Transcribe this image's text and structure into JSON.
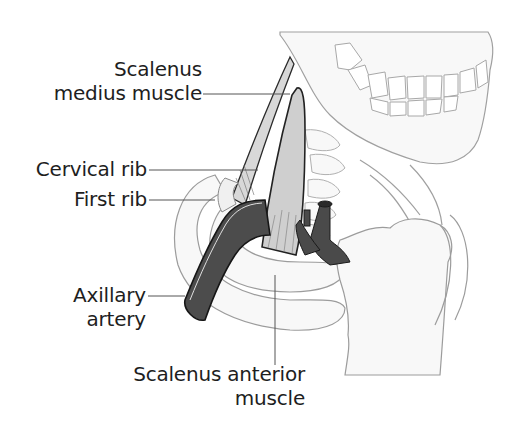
{
  "diagram": {
    "type": "anatomical illustration",
    "labels": {
      "scalenus_medius": {
        "line1": "Scalenus",
        "line2": "medius muscle"
      },
      "cervical_rib": "Cervical rib",
      "first_rib": "First rib",
      "axillary_artery": {
        "line1": "Axillary",
        "line2": "artery"
      },
      "scalenus_anterior": {
        "line1": "Scalenus anterior",
        "line2": "muscle"
      }
    },
    "colors": {
      "background": "#ffffff",
      "text": "#1e1e1e",
      "leader_line": "#555555",
      "bone_outline": "#9a9a9a",
      "bone_fill": "#f6f6f6",
      "muscle_fill": "#d2d2d2",
      "muscle_outline": "#2a2a2a",
      "artery_fill": "#4a4a4a",
      "artery_outline": "#1a1a1a"
    }
  }
}
